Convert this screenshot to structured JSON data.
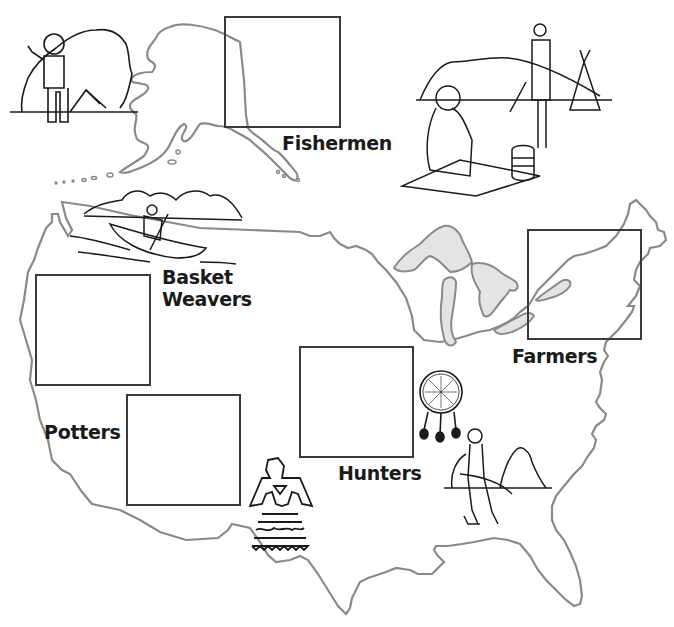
{
  "worksheet": {
    "subject": "Native American groups map of North America",
    "colors": {
      "outline": "#8a8a8a",
      "box_border": "#3a3a3a",
      "lakes_fill": "#e4e4e4",
      "label_text": "#1a1a1a",
      "background": "#ffffff"
    }
  },
  "regions": [
    {
      "id": "fishermen",
      "label": "Fishermen",
      "label_lines": [
        "Fishermen"
      ],
      "box": {
        "x": 224,
        "y": 16,
        "w": 117,
        "h": 112
      },
      "label_pos": {
        "x": 282,
        "y": 132
      }
    },
    {
      "id": "basket-weavers",
      "label": "Basket Weavers",
      "label_lines": [
        "Basket",
        "Weavers"
      ],
      "box": {
        "x": 35,
        "y": 274,
        "w": 116,
        "h": 112
      },
      "label_pos": {
        "x": 162,
        "y": 264
      }
    },
    {
      "id": "potters",
      "label": "Potters",
      "label_lines": [
        "Potters"
      ],
      "box": {
        "x": 126,
        "y": 394,
        "w": 115,
        "h": 112
      },
      "label_pos": {
        "x": 44,
        "y": 420
      }
    },
    {
      "id": "hunters",
      "label": "Hunters",
      "label_lines": [
        "Hunters"
      ],
      "box": {
        "x": 299,
        "y": 346,
        "w": 115,
        "h": 112
      },
      "label_pos": {
        "x": 338,
        "y": 462
      }
    },
    {
      "id": "farmers",
      "label": "Farmers",
      "label_lines": [
        "Farmers"
      ],
      "box": {
        "x": 527,
        "y": 229,
        "w": 115,
        "h": 111
      },
      "label_pos": {
        "x": 512,
        "y": 345
      }
    }
  ],
  "illustrations": [
    {
      "name": "inuit-person-igloo",
      "region": "arctic"
    },
    {
      "name": "plains-woman-with-pot-and-man-with-tipis",
      "region": "plains"
    },
    {
      "name": "canoe-paddler",
      "region": "northwest"
    },
    {
      "name": "thunderbird-symbol",
      "region": "southwest"
    },
    {
      "name": "dreamcatcher-shield",
      "region": "southeast"
    },
    {
      "name": "hunter-with-bow",
      "region": "southeast"
    }
  ]
}
